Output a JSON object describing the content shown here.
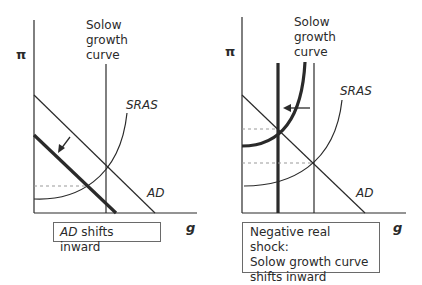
{
  "panels": [
    {
      "y_axis_label": "π",
      "x_axis_label": "g",
      "solow_label_lines": [
        "Solow",
        "growth",
        "curve"
      ],
      "sras_label": "SRAS",
      "ad_label": "AD",
      "caption_italic": "AD",
      "caption_rest": " shifts inward"
    },
    {
      "y_axis_label": "π",
      "x_axis_label": "g",
      "solow_label_lines": [
        "Solow",
        "growth",
        "curve"
      ],
      "sras_label": "SRAS",
      "ad_label": "AD",
      "caption_lines": [
        "Negative real shock:",
        "Solow growth curve",
        "shifts inward"
      ]
    }
  ],
  "colors": {
    "line": "#2a2a2a",
    "dash": "#999999",
    "box_border": "#6a6a6a"
  }
}
